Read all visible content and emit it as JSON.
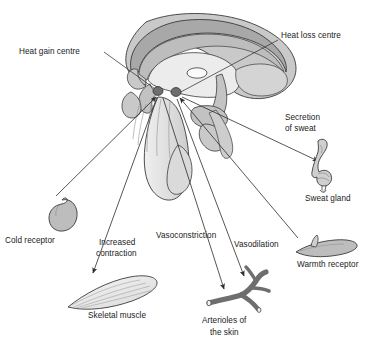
{
  "figure": {
    "type": "biological-diagram",
    "width": 380,
    "height": 351,
    "background": "#ffffff"
  },
  "palette": {
    "outline": "#3a3a3a",
    "brain_light": "#e8e8e8",
    "brain_mid": "#c9c9c9",
    "brain_dark": "#a8a8a8",
    "ventricle": "#f7f7f7",
    "centre_dot": "#6a6a6a",
    "arteriole": "#6e6e6e",
    "receptor_fill": "#bdbdbd",
    "muscle_fill": "#ededed",
    "gland_fill": "#cfcfcf",
    "text": "#1a1a1a",
    "leader_line": "#333333"
  },
  "labels": {
    "heat_gain_centre": "Heat gain centre",
    "heat_loss_centre": "Heat loss centre",
    "secretion_of_sweat_line1": "Secretion",
    "secretion_of_sweat_line2": "of sweat",
    "sweat_gland": "Sweat gland",
    "warmth_receptor": "Warmth receptor",
    "cold_receptor": "Cold receptor",
    "increased_contraction_line1": "Increased",
    "increased_contraction_line2": "contraction",
    "skeletal_muscle": "Skeletal muscle",
    "vasoconstriction": "Vasoconstriction",
    "vasodilation": "Vasodilation",
    "arterioles_line1": "Arterioles of",
    "arterioles_line2": "the skin"
  },
  "structures": [
    {
      "name": "corpus-callosum",
      "fill": "brain_dark"
    },
    {
      "name": "cerebral-hemisphere",
      "fill": "brain_mid"
    },
    {
      "name": "lateral-ventricle",
      "fill": "ventricle"
    },
    {
      "name": "thalamus",
      "fill": "brain_light"
    },
    {
      "name": "hypothalamus",
      "fill": "brain_mid"
    },
    {
      "name": "pituitary-gland",
      "fill": "brain_mid"
    },
    {
      "name": "brainstem",
      "fill": "brain_light"
    },
    {
      "name": "cerebellum",
      "fill": "brain_mid"
    },
    {
      "name": "heat-gain-centre-dot",
      "fill": "centre_dot"
    },
    {
      "name": "heat-loss-centre-dot",
      "fill": "centre_dot"
    }
  ],
  "effectors": [
    {
      "name": "cold-receptor",
      "label": "Cold receptor",
      "side": "left"
    },
    {
      "name": "skeletal-muscle",
      "label": "Skeletal muscle",
      "side": "left",
      "action": "Increased contraction"
    },
    {
      "name": "arterioles",
      "label": "Arterioles of the skin",
      "side": "centre",
      "actions": [
        "Vasoconstriction",
        "Vasodilation"
      ]
    },
    {
      "name": "sweat-gland",
      "label": "Sweat gland",
      "side": "right",
      "action": "Secretion of sweat"
    },
    {
      "name": "warmth-receptor",
      "label": "Warmth receptor",
      "side": "right"
    }
  ],
  "connections": [
    {
      "from": "heat-gain-centre-label",
      "to": "heat-gain-centre-dot",
      "arrow": false
    },
    {
      "from": "heat-loss-centre-label",
      "to": "heat-loss-centre-dot",
      "arrow": false
    },
    {
      "from": "cold-receptor",
      "to": "heat-gain-centre-dot",
      "arrow": true
    },
    {
      "from": "warmth-receptor",
      "to": "heat-loss-centre-dot",
      "arrow": true
    },
    {
      "from": "heat-gain-centre-dot",
      "to": "skeletal-muscle",
      "arrow": true
    },
    {
      "from": "heat-gain-centre-dot",
      "to": "arterioles",
      "arrow": true
    },
    {
      "from": "heat-loss-centre-dot",
      "to": "arterioles",
      "arrow": true
    },
    {
      "from": "heat-loss-centre-dot",
      "to": "sweat-gland",
      "arrow": true
    }
  ]
}
